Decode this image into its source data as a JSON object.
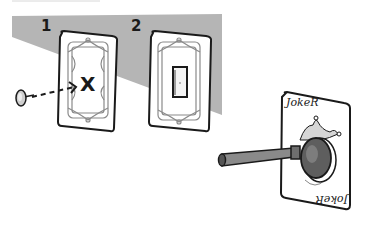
{
  "illustration": {
    "steps": [
      {
        "label": "1",
        "mark": "X",
        "description": "card with X mark, thumbtack pushed toward center"
      },
      {
        "label": "2",
        "description": "card with rectangular cutout window"
      }
    ],
    "joker_card": {
      "top_label": "JokeR",
      "bottom_label": "JokeR"
    },
    "icons": [
      "thumbtack-icon",
      "dashed-arrow-icon",
      "plunger-icon",
      "jester-hat-icon"
    ],
    "colors": {
      "background": "#ffffff",
      "wall_shadow": "#b5b5b5",
      "ink": "#1a1a1a",
      "card_face": "#ffffff",
      "ornament": "#8a8a8a",
      "plunger": "#7a7a7a",
      "plunger_cup": "#5e5e5e"
    }
  }
}
